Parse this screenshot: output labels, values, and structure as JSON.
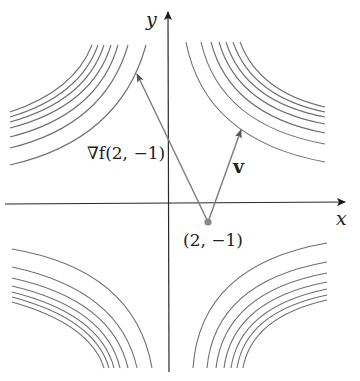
{
  "figure": {
    "axes": {
      "x_label": "x",
      "y_label": "y",
      "origin_px": [
        169,
        204
      ]
    },
    "point": {
      "label": "(2, −1)",
      "px": [
        208,
        222
      ],
      "color": "#8a8a8a"
    },
    "vectors": {
      "gradient": {
        "label": "∇f(2, −1)",
        "tail_px": [
          208,
          222
        ],
        "tip_px": [
          136,
          72
        ]
      },
      "v": {
        "label": "v",
        "tail_px": [
          208,
          222
        ],
        "tip_px": [
          242,
          128
        ]
      }
    },
    "level_curves": {
      "count_per_quadrant": 7,
      "stroke_color": "#6e6e6e",
      "quadrants": [
        "upper-left",
        "upper-right",
        "lower-left",
        "lower-right"
      ]
    },
    "colors": {
      "axis": "#2a2a2a",
      "vector": "#7a7a7a",
      "curve": "#6e6e6e",
      "background": "#ffffff"
    }
  }
}
